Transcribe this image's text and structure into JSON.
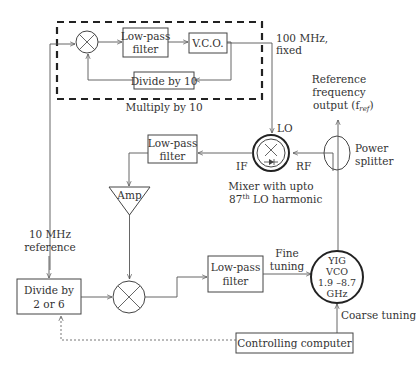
{
  "diagram": {
    "blocks": {
      "lpf_top": {
        "line1": "Low-pass",
        "line2": "filter"
      },
      "vco": {
        "label": "V.C.O."
      },
      "divide_by_10": {
        "label": "Divide by 10"
      },
      "multiply_by_10": {
        "label": "Multiply by 10"
      },
      "lpf_mid": {
        "line1": "Low-pass",
        "line2": "filter"
      },
      "amp": {
        "label": "Amp"
      },
      "divide_2_6": {
        "line1": "Divide by",
        "line2": "2 or 6"
      },
      "lpf_bottom": {
        "line1": "Low-pass",
        "line2": "filter"
      },
      "yig_vco": {
        "line1": "YIG",
        "line2": "VCO",
        "line3": "1.9 –8.7",
        "line4": "GHz"
      },
      "controlling_computer": {
        "label": "Controlling computer"
      }
    },
    "labels": {
      "freq_100": {
        "line1": "100 MHz,",
        "line2": "fixed"
      },
      "ref_10": {
        "line1": "10 MHz",
        "line2": "reference"
      },
      "ref_output": {
        "line1": "Reference",
        "line2": "frequency",
        "line3": "output (f",
        "sub": "ref",
        "close": ")"
      },
      "lo": "LO",
      "if": "IF",
      "rf": "RF",
      "mixer_caption": {
        "line1": "Mixer with upto",
        "line2_pre": "87",
        "line2_sup": "th",
        "line2_post": " LO harmonic"
      },
      "power_splitter": {
        "line1": "Power",
        "line2": "splitter"
      },
      "fine_tuning": {
        "line1": "Fine",
        "line2": "tuning"
      },
      "coarse_tuning": "Coarse tuning"
    },
    "connections": [
      {
        "from": "10 MHz reference",
        "to": "top mixer"
      },
      {
        "from": "top mixer",
        "to": "lpf_top"
      },
      {
        "from": "lpf_top",
        "to": "vco"
      },
      {
        "from": "vco",
        "to": "divide_by_10"
      },
      {
        "from": "divide_by_10",
        "to": "top mixer"
      },
      {
        "from": "vco",
        "to": "harmonic mixer LO",
        "label": "100 MHz, fixed"
      },
      {
        "from": "power_splitter",
        "to": "harmonic mixer RF"
      },
      {
        "from": "harmonic mixer IF",
        "to": "lpf_mid"
      },
      {
        "from": "lpf_mid",
        "to": "amp"
      },
      {
        "from": "amp",
        "to": "bottom mixer"
      },
      {
        "from": "10 MHz reference",
        "to": "divide_2_6"
      },
      {
        "from": "divide_2_6",
        "to": "bottom mixer"
      },
      {
        "from": "bottom mixer",
        "to": "lpf_bottom"
      },
      {
        "from": "lpf_bottom",
        "to": "yig_vco",
        "label": "Fine tuning"
      },
      {
        "from": "controlling_computer",
        "to": "yig_vco",
        "label": "Coarse tuning"
      },
      {
        "from": "controlling_computer",
        "to": "divide_2_6",
        "style": "dotted"
      },
      {
        "from": "yig_vco",
        "to": "power_splitter"
      },
      {
        "from": "power_splitter",
        "to": "reference frequency output"
      }
    ]
  }
}
